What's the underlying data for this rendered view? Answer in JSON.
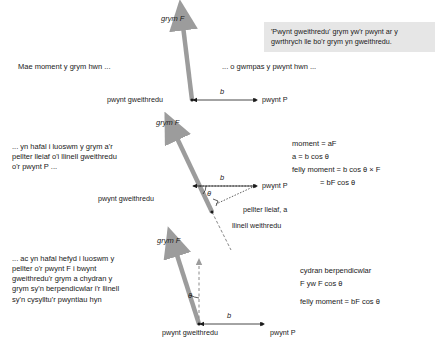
{
  "page": {
    "language": "cy",
    "width": 441,
    "height": 348,
    "bg": "#ffffff",
    "arrow_color": "#9c9c9c",
    "note_bg": "#e6e6e6",
    "text_color": "#1a1a1a"
  },
  "note": {
    "text": "'Pwynt gweithredu' grym yw'r pwynt ar y\ngwrthrych lle bo'r grym yn gweithredu."
  },
  "panel1": {
    "lead_text": "Mae moment y grym hwn ...",
    "right_text": "... o gwmpas y pwynt hwn ...",
    "force_label": "grym F",
    "action_point_label": "pwynt gweithredu",
    "distance_label": "b",
    "point_p_label": "pwynt P"
  },
  "panel2": {
    "lead_text": "... yn hafal i luoswm y grym a'r\npellter lleiaf o'i llinell gweithredu\no'r pwynt P ...",
    "force_label": "grym F",
    "action_point_label": "pwynt gweithredu",
    "distance_label": "b",
    "angle_label": "θ",
    "point_p_label": "pwynt P",
    "perp_distance_label": "pellter lleiaf, a",
    "line_of_action_label": "llinell weithredu",
    "equations": [
      "moment = aF",
      "a = b cos θ",
      "felly moment = b cos θ × F",
      "= bF cos θ"
    ]
  },
  "panel3": {
    "lead_text": "... ac yn hafal hefyd i luoswm y\npellter o'r pwynt F i bwynt\ngweithredu'r grym a chydran y\ngrym sy'n berpendicwlar i'r llinell\nsy'n cysylltu'r pwyntiau hyn",
    "force_label": "grym F",
    "angle_label": "θ",
    "distance_label": "b",
    "action_point_label": "pwynt gweithredu",
    "point_p_label": "pwynt P",
    "equations": [
      "cydran berpendicwlar",
      "F yw F cos θ",
      "felly moment = bF cos θ"
    ]
  }
}
